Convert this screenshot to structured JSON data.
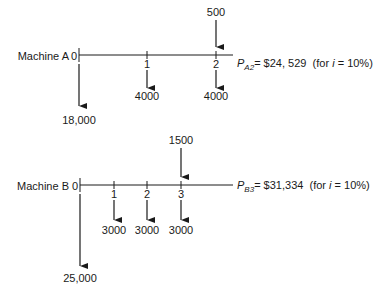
{
  "diagram": {
    "type": "cash-flow-diagram",
    "interest_rate_label": "i = 10%",
    "machines": [
      {
        "label": "Machine A",
        "periods": [
          "0",
          "1",
          "2"
        ],
        "cash_flows": [
          {
            "period": 0,
            "amount": "18,000",
            "direction": "down"
          },
          {
            "period": 1,
            "amount": "4000",
            "direction": "down"
          },
          {
            "period": 2,
            "amount": "4000",
            "direction": "down"
          },
          {
            "period": 2,
            "amount": "500",
            "direction": "up"
          }
        ],
        "pv_symbol": "P",
        "pv_subscript": "A2",
        "pv_value": "= $24, 529",
        "pv_note_prefix": "(for ",
        "pv_note_var": "i",
        "pv_note_suffix": " = 10%)"
      },
      {
        "label": "Machine B",
        "periods": [
          "0",
          "1",
          "2",
          "3"
        ],
        "cash_flows": [
          {
            "period": 0,
            "amount": "25,000",
            "direction": "down"
          },
          {
            "period": 1,
            "amount": "3000",
            "direction": "down"
          },
          {
            "period": 2,
            "amount": "3000",
            "direction": "down"
          },
          {
            "period": 3,
            "amount": "3000",
            "direction": "down"
          },
          {
            "period": 3,
            "amount": "1500",
            "direction": "up"
          }
        ],
        "pv_symbol": "P",
        "pv_subscript": "B3",
        "pv_value": "= $31,334",
        "pv_note_prefix": "(for ",
        "pv_note_var": "i",
        "pv_note_suffix": " = 10%)"
      }
    ]
  }
}
